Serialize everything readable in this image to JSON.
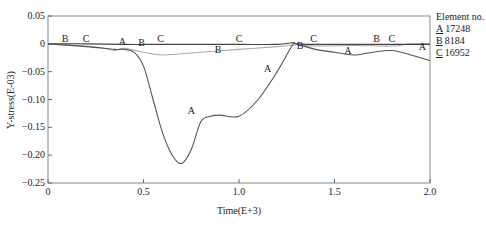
{
  "chart_data": {
    "type": "line",
    "title": "",
    "xlabel": "Time(E+3)",
    "ylabel": "Y-stress(E-03)",
    "xlim": [
      0,
      2.0
    ],
    "ylim": [
      -0.25,
      0.05
    ],
    "x_ticks": [
      "0",
      "0.5",
      "1.0",
      "1.5",
      "2.0"
    ],
    "y_ticks": [
      "0.05",
      "0",
      "−0.05",
      "−0.10",
      "−0.15",
      "−0.20",
      "−0.25"
    ],
    "grid": false,
    "legend_position": "right",
    "legend_title": "Element no.",
    "series": [
      {
        "name": "A",
        "element": "17248",
        "color": "#555555",
        "x": [
          0,
          0.2,
          0.35,
          0.4,
          0.45,
          0.5,
          0.55,
          0.6,
          0.65,
          0.7,
          0.75,
          0.8,
          0.85,
          0.9,
          1.0,
          1.1,
          1.2,
          1.28,
          1.3,
          1.4,
          1.5,
          1.6,
          1.7,
          1.8,
          1.9,
          2.0
        ],
        "y": [
          0,
          -0.005,
          -0.01,
          -0.01,
          -0.015,
          -0.04,
          -0.1,
          -0.16,
          -0.2,
          -0.215,
          -0.19,
          -0.14,
          -0.13,
          -0.128,
          -0.13,
          -0.1,
          -0.05,
          -0.002,
          0.0,
          -0.01,
          -0.015,
          -0.02,
          -0.015,
          -0.012,
          -0.02,
          -0.03
        ]
      },
      {
        "name": "B",
        "element": "8184",
        "color": "#aaaaaa",
        "x": [
          0,
          0.2,
          0.3,
          0.35,
          0.4,
          0.5,
          0.6,
          0.8,
          1.0,
          1.2,
          1.3,
          1.4,
          1.6,
          1.8,
          1.9,
          2.0
        ],
        "y": [
          0,
          -0.004,
          -0.008,
          -0.012,
          -0.008,
          -0.015,
          -0.02,
          -0.015,
          -0.01,
          -0.005,
          -0.002,
          -0.004,
          -0.003,
          -0.004,
          0.0,
          0.0
        ]
      },
      {
        "name": "C",
        "element": "16952",
        "color": "#444444",
        "x": [
          0,
          0.2,
          0.4,
          0.6,
          0.8,
          1.0,
          1.2,
          1.28,
          1.3,
          1.4,
          1.6,
          1.8,
          2.0
        ],
        "y": [
          0,
          0,
          -0.001,
          -0.001,
          -0.001,
          -0.001,
          -0.001,
          0.002,
          0.0,
          -0.001,
          -0.001,
          -0.001,
          -0.001
        ]
      }
    ],
    "annotations": [
      {
        "text": "B",
        "x": 0.09,
        "y": 0.0
      },
      {
        "text": "C",
        "x": 0.2,
        "y": 0.0
      },
      {
        "text": "A",
        "x": 0.39,
        "y": -0.005
      },
      {
        "text": "B",
        "x": 0.49,
        "y": -0.008
      },
      {
        "text": "C",
        "x": 0.59,
        "y": 0.0
      },
      {
        "text": "C",
        "x": 1.0,
        "y": 0.0
      },
      {
        "text": "B",
        "x": 0.89,
        "y": -0.02
      },
      {
        "text": "A",
        "x": 1.15,
        "y": -0.055
      },
      {
        "text": "A",
        "x": 0.75,
        "y": -0.13
      },
      {
        "text": "B",
        "x": 1.32,
        "y": -0.012
      },
      {
        "text": "C",
        "x": 1.39,
        "y": 0.0
      },
      {
        "text": "A",
        "x": 1.57,
        "y": -0.022
      },
      {
        "text": "B",
        "x": 1.72,
        "y": 0.0
      },
      {
        "text": "C",
        "x": 1.8,
        "y": 0.0
      },
      {
        "text": "A",
        "x": 1.96,
        "y": -0.015
      }
    ]
  },
  "legend": {
    "title": "Element no.",
    "items": [
      {
        "key": "A",
        "label": "17248"
      },
      {
        "key": "B",
        "label": "8184"
      },
      {
        "key": "C",
        "label": "16952"
      }
    ]
  }
}
